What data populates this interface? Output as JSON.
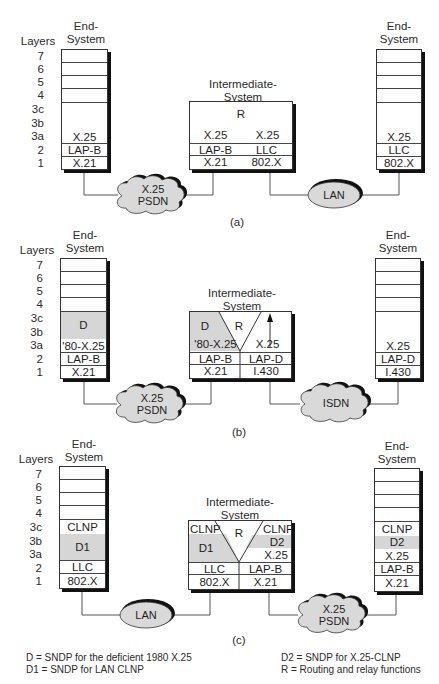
{
  "labels": {
    "layers": "Layers",
    "end_system": [
      "End-",
      "System"
    ],
    "intermediate_system": [
      "Intermediate-",
      "System"
    ],
    "layer_numbers": [
      "7",
      "6",
      "5",
      "4",
      "3c",
      "3b",
      "3a",
      "2",
      "1"
    ],
    "routing": "R"
  },
  "diagrams": [
    {
      "id": "a",
      "caption": "(a)",
      "left_end": {
        "layer3": "X.25",
        "layer2": "LAP-B",
        "layer1": "X.21"
      },
      "intermediate": {
        "left": {
          "layer3": "X.25",
          "layer2": "LAP-B",
          "layer1": "X.21"
        },
        "right": {
          "layer3": "X.25",
          "layer2": "LLC",
          "layer1": "802.X"
        }
      },
      "right_end": {
        "layer3": "X.25",
        "layer2": "LLC",
        "layer1": "802.X"
      },
      "left_network": {
        "shape": "cloud",
        "lines": [
          "X.25",
          "PSDN"
        ]
      },
      "right_network": {
        "shape": "ellipse",
        "lines": [
          "LAN"
        ]
      }
    },
    {
      "id": "b",
      "caption": "(b)",
      "left_end": {
        "layer3_upper": "D",
        "layer3": "'80-X.25",
        "layer2": "LAP-B",
        "layer1": "X.21"
      },
      "intermediate": {
        "left": {
          "layer3_upper": "D",
          "layer3": "'80-X.25",
          "layer2": "LAP-B",
          "layer1": "X.21"
        },
        "right": {
          "layer3": "X.25",
          "layer2": "LAP-D",
          "layer1": "I.430"
        }
      },
      "right_end": {
        "layer3": "X.25",
        "layer2": "LAP-D",
        "layer1": "I.430"
      },
      "left_network": {
        "shape": "cloud",
        "lines": [
          "X.25",
          "PSDN"
        ]
      },
      "right_network": {
        "shape": "cloud",
        "lines": [
          "ISDN"
        ]
      }
    },
    {
      "id": "c",
      "caption": "(c)",
      "left_end": {
        "layer3c": "CLNP",
        "layer3ab": "D1",
        "layer2": "LLC",
        "layer1": "802.X"
      },
      "intermediate": {
        "left": {
          "layer3c": "CLNP",
          "layer3ab": "D1",
          "layer2": "LLC",
          "layer1": "802.X"
        },
        "right": {
          "layer3c": "CLNP",
          "layer3b": "D2",
          "layer3a": "X.25",
          "layer2": "LAP-B",
          "layer1": "X.21"
        }
      },
      "right_end": {
        "layer3c": "CLNP",
        "layer3b": "D2",
        "layer3a": "X.25",
        "layer2": "LAP-B",
        "layer1": "X.21"
      },
      "left_network": {
        "shape": "ellipse",
        "lines": [
          "LAN"
        ]
      },
      "right_network": {
        "shape": "cloud",
        "lines": [
          "X.25",
          "PSDN"
        ]
      }
    }
  ],
  "legend": {
    "left": [
      "D = SNDP for the deficient 1980 X.25",
      "D1 = SNDP for LAN CLNP"
    ],
    "right": [
      "D2 = SNDP for X.25-CLNP",
      "R = Routing and relay functions"
    ]
  },
  "colors": {
    "shade": "#d6d6d6",
    "network_fill": "#d9d9d9",
    "line": "#333333"
  }
}
